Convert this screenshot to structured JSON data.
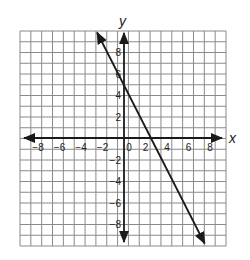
{
  "chart_data": {
    "type": "line",
    "title": "",
    "xlabel": "x",
    "ylabel": "y",
    "xlim": [
      -9.5,
      9.5
    ],
    "ylim": [
      -10,
      10
    ],
    "grid": true,
    "grid_step": 1,
    "x_ticks": [
      -8,
      -6,
      -4,
      -2,
      0,
      2,
      4,
      6,
      8
    ],
    "x_tick_labels": [
      "−8",
      "−6",
      "−4",
      "−2",
      "0",
      "2",
      "4",
      "6",
      "8"
    ],
    "y_ticks": [
      8,
      6,
      4,
      2,
      -2,
      -4,
      -6,
      -8
    ],
    "y_tick_labels": [
      "8",
      "6",
      "4",
      "2",
      "−2",
      "−4",
      "−6",
      "−8"
    ],
    "series": [
      {
        "name": "line",
        "equation": "y = -2x + 5",
        "slope": -2,
        "intercept": 5,
        "x": [
          -2.5,
          7.5
        ],
        "y": [
          10,
          -10
        ],
        "arrows": "both",
        "color": "#1a1a1a"
      }
    ],
    "legend": null
  },
  "labels": {
    "x_axis": "x",
    "y_axis": "y"
  },
  "colors": {
    "grid": "#8a8a8a",
    "axis": "#1a1a1a",
    "line": "#1a1a1a",
    "background": "#ffffff"
  }
}
